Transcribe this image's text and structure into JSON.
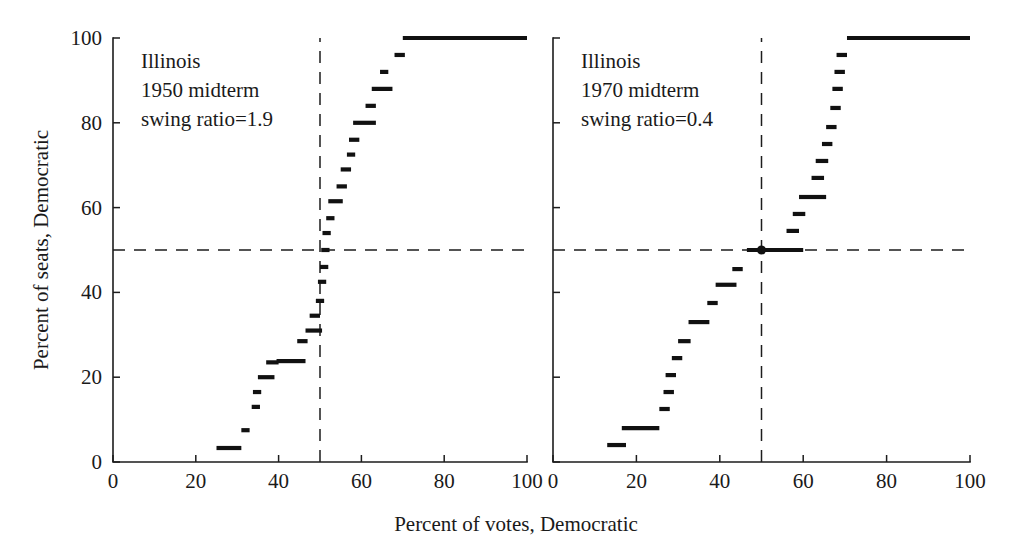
{
  "figure": {
    "width": 1032,
    "height": 556,
    "background": "#ffffff",
    "ink_color": "#111111",
    "shared_xlabel": "Percent of votes, Democratic",
    "shared_ylabel": "Percent of seats, Democratic"
  },
  "chart_data": [
    {
      "type": "line",
      "panel": "left",
      "title": "",
      "annotation_lines": [
        "Illinois",
        "1950 midterm",
        "swing ratio=1.9"
      ],
      "state": "Illinois",
      "year_label": "1950 midterm",
      "swing_ratio_label": "swing ratio=1.9",
      "swing_ratio": 1.9,
      "xlabel": "Percent of votes, Democratic",
      "ylabel": "Percent of seats, Democratic",
      "xlim": [
        0,
        100
      ],
      "ylim": [
        0,
        100
      ],
      "xticks": [
        0,
        20,
        40,
        60,
        80,
        100
      ],
      "yticks": [
        0,
        20,
        40,
        60,
        80,
        100
      ],
      "xticklabels": [
        "0",
        "20",
        "40",
        "60",
        "80",
        "100"
      ],
      "yticklabels": [
        "0",
        "20",
        "40",
        "60",
        "80",
        "100"
      ],
      "grid": false,
      "legend": "none",
      "reference_lines": [
        {
          "orientation": "vertical",
          "value": 50,
          "style": "dashed"
        },
        {
          "orientation": "horizontal",
          "value": 50,
          "style": "dashed"
        }
      ],
      "step_segments": [
        {
          "x0": 25.0,
          "x1": 31.0,
          "y": 3.3
        },
        {
          "x0": 31.0,
          "x1": 33.0,
          "y": 7.5
        },
        {
          "x0": 33.5,
          "x1": 35.5,
          "y": 13.0
        },
        {
          "x0": 33.8,
          "x1": 35.8,
          "y": 16.5
        },
        {
          "x0": 35.0,
          "x1": 39.0,
          "y": 20.0
        },
        {
          "x0": 37.0,
          "x1": 40.0,
          "y": 23.5
        },
        {
          "x0": 39.5,
          "x1": 46.5,
          "y": 23.8
        },
        {
          "x0": 44.5,
          "x1": 47.0,
          "y": 28.5
        },
        {
          "x0": 46.5,
          "x1": 50.5,
          "y": 31.0
        },
        {
          "x0": 47.5,
          "x1": 50.0,
          "y": 34.5
        },
        {
          "x0": 49.0,
          "x1": 51.0,
          "y": 38.0
        },
        {
          "x0": 49.5,
          "x1": 51.5,
          "y": 42.5
        },
        {
          "x0": 50.0,
          "x1": 52.0,
          "y": 46.0
        },
        {
          "x0": 50.3,
          "x1": 52.3,
          "y": 50.0
        },
        {
          "x0": 50.6,
          "x1": 52.6,
          "y": 54.0
        },
        {
          "x0": 51.5,
          "x1": 53.5,
          "y": 57.5
        },
        {
          "x0": 52.0,
          "x1": 55.5,
          "y": 61.5
        },
        {
          "x0": 54.0,
          "x1": 56.5,
          "y": 65.0
        },
        {
          "x0": 55.0,
          "x1": 57.5,
          "y": 69.0
        },
        {
          "x0": 56.5,
          "x1": 58.5,
          "y": 72.5
        },
        {
          "x0": 57.0,
          "x1": 59.5,
          "y": 76.0
        },
        {
          "x0": 58.0,
          "x1": 63.5,
          "y": 80.0
        },
        {
          "x0": 61.0,
          "x1": 63.5,
          "y": 84.0
        },
        {
          "x0": 62.5,
          "x1": 67.5,
          "y": 88.0
        },
        {
          "x0": 64.5,
          "x1": 66.5,
          "y": 92.0
        },
        {
          "x0": 68.0,
          "x1": 70.5,
          "y": 96.0
        },
        {
          "x0": 70.0,
          "x1": 100.0,
          "y": 100.0
        }
      ],
      "crossing_marker": null
    },
    {
      "type": "line",
      "panel": "right",
      "title": "",
      "annotation_lines": [
        "Illinois",
        "1970 midterm",
        "swing ratio=0.4"
      ],
      "state": "Illinois",
      "year_label": "1970 midterm",
      "swing_ratio_label": "swing ratio=0.4",
      "swing_ratio": 0.4,
      "xlabel": "Percent of votes, Democratic",
      "ylabel": "Percent of seats, Democratic",
      "xlim": [
        0,
        100
      ],
      "ylim": [
        0,
        100
      ],
      "xticks": [
        0,
        20,
        40,
        60,
        80,
        100
      ],
      "yticks": [
        0,
        20,
        40,
        60,
        80,
        100
      ],
      "xticklabels": [
        "0",
        "20",
        "40",
        "60",
        "80",
        "100"
      ],
      "yticklabels": [
        "0",
        "20",
        "40",
        "60",
        "80",
        "100"
      ],
      "grid": false,
      "legend": "none",
      "reference_lines": [
        {
          "orientation": "vertical",
          "value": 50,
          "style": "dashed"
        },
        {
          "orientation": "horizontal",
          "value": 50,
          "style": "dashed"
        }
      ],
      "step_segments": [
        {
          "x0": 13.0,
          "x1": 17.5,
          "y": 4.0
        },
        {
          "x0": 16.5,
          "x1": 25.5,
          "y": 8.0
        },
        {
          "x0": 25.5,
          "x1": 28.0,
          "y": 12.5
        },
        {
          "x0": 26.5,
          "x1": 29.0,
          "y": 16.5
        },
        {
          "x0": 27.0,
          "x1": 29.5,
          "y": 20.5
        },
        {
          "x0": 28.5,
          "x1": 31.0,
          "y": 24.5
        },
        {
          "x0": 30.0,
          "x1": 33.0,
          "y": 28.5
        },
        {
          "x0": 32.5,
          "x1": 37.5,
          "y": 33.0
        },
        {
          "x0": 37.0,
          "x1": 39.5,
          "y": 37.5
        },
        {
          "x0": 39.0,
          "x1": 44.0,
          "y": 41.8
        },
        {
          "x0": 43.0,
          "x1": 45.5,
          "y": 45.5
        },
        {
          "x0": 46.5,
          "x1": 60.0,
          "y": 50.0
        },
        {
          "x0": 56.0,
          "x1": 59.0,
          "y": 54.5
        },
        {
          "x0": 57.5,
          "x1": 60.5,
          "y": 58.5
        },
        {
          "x0": 59.0,
          "x1": 65.5,
          "y": 62.5
        },
        {
          "x0": 62.0,
          "x1": 65.0,
          "y": 67.0
        },
        {
          "x0": 63.0,
          "x1": 66.0,
          "y": 71.0
        },
        {
          "x0": 64.5,
          "x1": 67.0,
          "y": 75.0
        },
        {
          "x0": 65.5,
          "x1": 68.0,
          "y": 79.0
        },
        {
          "x0": 66.5,
          "x1": 69.0,
          "y": 83.5
        },
        {
          "x0": 67.0,
          "x1": 69.5,
          "y": 88.0
        },
        {
          "x0": 67.5,
          "x1": 70.0,
          "y": 92.0
        },
        {
          "x0": 68.0,
          "x1": 70.5,
          "y": 96.0
        },
        {
          "x0": 70.5,
          "x1": 100.0,
          "y": 100.0
        }
      ],
      "crossing_marker": {
        "x": 50,
        "y": 50
      }
    }
  ]
}
